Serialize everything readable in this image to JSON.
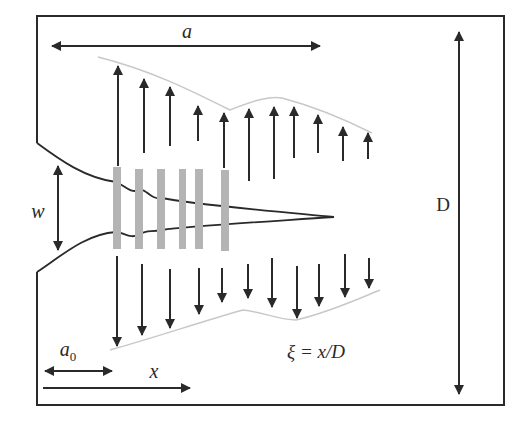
{
  "diagram": {
    "type": "fracture-process-zone-schematic",
    "colors": {
      "line": "#2a2a2a",
      "bridge": "#b4b4b4",
      "envelope": "#c8c8c8",
      "background": "#ffffff"
    },
    "labels": {
      "a": "a",
      "w": "w",
      "D": "D",
      "a0_base": "a",
      "a0_sub": "0",
      "x": "x",
      "xi_formula": "ξ = x/D"
    },
    "dimensions": [
      {
        "name": "crack-length-a",
        "label": "a",
        "orientation": "horizontal",
        "double_headed": true
      },
      {
        "name": "width-w",
        "label": "w",
        "orientation": "vertical",
        "double_headed": true
      },
      {
        "name": "depth-D",
        "label": "D",
        "orientation": "vertical",
        "double_headed": true
      },
      {
        "name": "notch-a0",
        "label": "a0",
        "orientation": "horizontal",
        "double_headed": true
      },
      {
        "name": "position-x",
        "label": "x",
        "orientation": "horizontal",
        "double_headed": false
      }
    ],
    "upper_arrows": {
      "direction": "up",
      "items": [
        {
          "x": 118,
          "tip": 66,
          "base": 166
        },
        {
          "x": 144,
          "tip": 79,
          "base": 153
        },
        {
          "x": 170,
          "tip": 87,
          "base": 146
        },
        {
          "x": 198,
          "tip": 106,
          "base": 141
        },
        {
          "x": 224,
          "tip": 113,
          "base": 168
        },
        {
          "x": 249,
          "tip": 109,
          "base": 181
        },
        {
          "x": 274,
          "tip": 107,
          "base": 179
        },
        {
          "x": 294,
          "tip": 107,
          "base": 158
        },
        {
          "x": 318,
          "tip": 115,
          "base": 153
        },
        {
          "x": 343,
          "tip": 127,
          "base": 161
        },
        {
          "x": 368,
          "tip": 133,
          "base": 159
        }
      ]
    },
    "lower_arrows": {
      "direction": "down",
      "items": [
        {
          "x": 117,
          "tip": 346,
          "base": 256
        },
        {
          "x": 142,
          "tip": 335,
          "base": 264
        },
        {
          "x": 170,
          "tip": 328,
          "base": 269
        },
        {
          "x": 199,
          "tip": 314,
          "base": 268
        },
        {
          "x": 222,
          "tip": 302,
          "base": 268
        },
        {
          "x": 248,
          "tip": 298,
          "base": 264
        },
        {
          "x": 272,
          "tip": 307,
          "base": 258
        },
        {
          "x": 297,
          "tip": 318,
          "base": 266
        },
        {
          "x": 319,
          "tip": 306,
          "base": 264
        },
        {
          "x": 345,
          "tip": 297,
          "base": 254
        },
        {
          "x": 369,
          "tip": 288,
          "base": 258
        }
      ]
    },
    "bridges": [
      {
        "x": 117,
        "top": 167,
        "bottom": 249
      },
      {
        "x": 139,
        "top": 169,
        "bottom": 249
      },
      {
        "x": 161,
        "top": 169,
        "bottom": 249
      },
      {
        "x": 182,
        "top": 169,
        "bottom": 249
      },
      {
        "x": 199,
        "top": 169,
        "bottom": 249
      },
      {
        "x": 225,
        "top": 170,
        "bottom": 251
      }
    ]
  }
}
